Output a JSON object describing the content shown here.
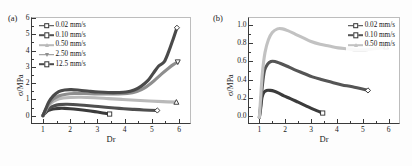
{
  "figure": {
    "panels": [
      {
        "tag": "(a)",
        "xlabel": "Dr",
        "ylabel": "σ/MPa",
        "xlim": [
          0.6,
          6.4
        ],
        "ylim": [
          -0.45,
          6.0
        ],
        "xticks": [
          1,
          2,
          3,
          4,
          5,
          6
        ],
        "yticks": [
          0,
          1,
          2,
          3,
          4,
          5,
          6
        ],
        "xtick_labels": [
          "1",
          "2",
          "3",
          "4",
          "5",
          "6"
        ],
        "ytick_labels": [
          "0",
          "1",
          "2",
          "3",
          "4",
          "5",
          "6"
        ],
        "legend_position": "upper-left",
        "legend": [
          {
            "label": "0.02 mm/s",
            "marker": "open-square",
            "color": "#3b3b3b"
          },
          {
            "label": "0.10 mm/s",
            "marker": "open-diamond",
            "color": "#4f4f4f"
          },
          {
            "label": "0.50 mm/s",
            "marker": "open-triangle-up",
            "color": "#b9b9b9"
          },
          {
            "label": "2.50 mm/s",
            "marker": "open-triangle-down",
            "color": "#8e8e8e"
          },
          {
            "label": "12.5 mm/s",
            "marker": "open-diamond",
            "color": "#4a4a4a"
          }
        ]
      },
      {
        "tag": "(b)",
        "xlabel": "Dr",
        "ylabel": "σ/MPa",
        "xlim": [
          0.6,
          6.4
        ],
        "ylim": [
          -0.08,
          1.08
        ],
        "xticks": [
          1,
          2,
          3,
          4,
          5,
          6
        ],
        "yticks": [
          0.0,
          0.2,
          0.4,
          0.6,
          0.8,
          1.0
        ],
        "xtick_labels": [
          "1",
          "2",
          "3",
          "4",
          "5",
          "6"
        ],
        "ytick_labels": [
          "0.0",
          "0.2",
          "0.4",
          "0.6",
          "0.8",
          "1.0"
        ],
        "legend_position": "upper-right",
        "legend": [
          {
            "label": "0.02 mm/s",
            "marker": "open-square",
            "color": "#3b3b3b"
          },
          {
            "label": "0.10 mm/s",
            "marker": "open-diamond",
            "color": "#555555"
          },
          {
            "label": "0.50 mm/s",
            "marker": "open-triangle-up",
            "color": "#c2c2c2"
          }
        ]
      }
    ]
  },
  "chart_data": [
    {
      "type": "line",
      "panel": "(a)",
      "title": "",
      "xlabel": "Dr",
      "ylabel": "σ/MPa",
      "xlim": [
        0.6,
        6.4
      ],
      "ylim": [
        -0.45,
        6.0
      ],
      "grid": false,
      "legend_position": "upper-left",
      "series": [
        {
          "name": "0.02 mm/s",
          "color": "#3b3b3b",
          "marker": "open-square",
          "endpoint_marker": true,
          "x": [
            1.0,
            1.05,
            1.12,
            1.2,
            1.3,
            1.45,
            1.6,
            1.8,
            2.0,
            2.3,
            2.6,
            2.9,
            3.2,
            3.45
          ],
          "y": [
            0.0,
            0.1,
            0.22,
            0.32,
            0.38,
            0.43,
            0.45,
            0.45,
            0.43,
            0.38,
            0.32,
            0.25,
            0.17,
            0.1
          ]
        },
        {
          "name": "0.10 mm/s",
          "color": "#4f4f4f",
          "marker": "open-diamond",
          "endpoint_marker": true,
          "x": [
            1.0,
            1.06,
            1.15,
            1.25,
            1.4,
            1.6,
            1.85,
            2.1,
            2.5,
            2.9,
            3.3,
            3.8,
            4.3,
            4.7,
            5.2
          ],
          "y": [
            0.0,
            0.14,
            0.32,
            0.48,
            0.6,
            0.68,
            0.7,
            0.69,
            0.64,
            0.58,
            0.52,
            0.45,
            0.39,
            0.35,
            0.32
          ]
        },
        {
          "name": "0.50 mm/s",
          "color": "#b9b9b9",
          "marker": "open-triangle-up",
          "endpoint_marker": true,
          "x": [
            1.0,
            1.08,
            1.18,
            1.3,
            1.5,
            1.75,
            2.0,
            2.4,
            2.9,
            3.4,
            3.9,
            4.4,
            4.9,
            5.4,
            5.9
          ],
          "y": [
            0.0,
            0.25,
            0.55,
            0.78,
            0.98,
            1.08,
            1.12,
            1.13,
            1.1,
            1.05,
            1.0,
            0.95,
            0.9,
            0.86,
            0.83
          ]
        },
        {
          "name": "2.50 mm/s",
          "color": "#8e8e8e",
          "marker": "open-triangle-down",
          "endpoint_marker": true,
          "x": [
            1.0,
            1.1,
            1.22,
            1.38,
            1.6,
            1.85,
            2.15,
            2.5,
            2.9,
            3.3,
            3.7,
            4.1,
            4.45,
            4.75,
            5.05,
            5.35,
            5.6,
            5.8,
            5.95
          ],
          "y": [
            0.0,
            0.35,
            0.72,
            1.02,
            1.22,
            1.32,
            1.36,
            1.36,
            1.34,
            1.33,
            1.33,
            1.36,
            1.48,
            1.72,
            2.1,
            2.55,
            2.9,
            3.15,
            3.3
          ]
        },
        {
          "name": "12.5 mm/s",
          "color": "#4a4a4a",
          "marker": "open-diamond",
          "endpoint_marker": true,
          "x": [
            1.0,
            1.1,
            1.22,
            1.38,
            1.58,
            1.8,
            2.05,
            2.35,
            2.7,
            3.05,
            3.4,
            3.75,
            4.05,
            4.35,
            4.6,
            4.85,
            5.05,
            5.25,
            5.45,
            5.62,
            5.78,
            5.92
          ],
          "y": [
            0.0,
            0.4,
            0.85,
            1.22,
            1.48,
            1.58,
            1.6,
            1.56,
            1.5,
            1.45,
            1.42,
            1.42,
            1.45,
            1.58,
            1.8,
            2.15,
            2.6,
            3.05,
            3.3,
            3.95,
            4.7,
            5.4
          ]
        }
      ]
    },
    {
      "type": "line",
      "panel": "(b)",
      "title": "",
      "xlabel": "Dr",
      "ylabel": "σ/MPa",
      "xlim": [
        0.6,
        6.4
      ],
      "ylim": [
        -0.08,
        1.08
      ],
      "grid": false,
      "legend_position": "upper-right",
      "series": [
        {
          "name": "0.02 mm/s",
          "color": "#3b3b3b",
          "marker": "open-square",
          "endpoint_marker": true,
          "x": [
            1.0,
            1.05,
            1.1,
            1.18,
            1.28,
            1.42,
            1.58,
            1.75,
            1.95,
            2.2,
            2.5,
            2.8,
            3.1,
            3.45
          ],
          "y": [
            -0.02,
            0.08,
            0.2,
            0.26,
            0.28,
            0.28,
            0.27,
            0.25,
            0.22,
            0.19,
            0.15,
            0.11,
            0.07,
            0.03
          ]
        },
        {
          "name": "0.10 mm/s",
          "color": "#555555",
          "marker": "open-diamond",
          "endpoint_marker": true,
          "x": [
            1.0,
            1.06,
            1.12,
            1.2,
            1.32,
            1.45,
            1.6,
            1.8,
            2.05,
            2.35,
            2.7,
            3.05,
            3.4,
            3.8,
            4.2,
            4.6,
            5.2
          ],
          "y": [
            -0.02,
            0.14,
            0.34,
            0.5,
            0.57,
            0.6,
            0.6,
            0.58,
            0.55,
            0.51,
            0.47,
            0.43,
            0.4,
            0.37,
            0.34,
            0.32,
            0.28
          ]
        },
        {
          "name": "0.50 mm/s",
          "color": "#c2c2c2",
          "marker": "open-triangle-up",
          "endpoint_marker": true,
          "x": [
            1.0,
            1.05,
            1.12,
            1.22,
            1.35,
            1.5,
            1.7,
            1.9,
            2.1,
            2.4,
            2.7,
            3.0,
            3.35,
            3.7,
            4.05,
            4.4,
            4.75,
            5.1,
            5.45,
            5.7,
            5.9
          ],
          "y": [
            -0.02,
            0.2,
            0.48,
            0.7,
            0.84,
            0.92,
            0.96,
            0.96,
            0.94,
            0.9,
            0.86,
            0.82,
            0.79,
            0.77,
            0.75,
            0.74,
            0.73,
            0.73,
            0.74,
            0.75,
            0.76
          ]
        }
      ]
    }
  ]
}
